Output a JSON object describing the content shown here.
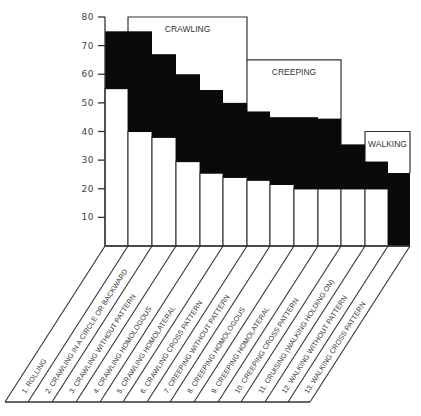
{
  "chart_data": {
    "type": "bar",
    "subtype": "floating-range",
    "title": "",
    "xlabel": "",
    "ylabel": "",
    "ylim": [
      0,
      80
    ],
    "yticks": [
      10,
      20,
      30,
      40,
      50,
      60,
      70,
      80
    ],
    "grid": false,
    "legend": null,
    "categories": [
      "1. ROLLING",
      "2. CRAWLING IN A CIRCLE OR BACKWARD",
      "3. CRAWLING WITHOUT PATTERN",
      "4. CRAWLING HOMOLOGOUS",
      "5. CRAWLING HOMOLATERAL",
      "6. CRAWLING CROSS PATTERN",
      "7. CREEPING WITHOUT PATTERN",
      "8. CREEPING HOMOLOGOUS",
      "9. CREEPING HOMOLATERAL",
      "10. CREEPING CROSS PATTERN",
      "11. CRUISING (WALKING HOLDING ON)",
      "12. WALKING WITHOUT PATTERN",
      "13. WALKING CROSS PATTERN"
    ],
    "series": [
      {
        "name": "range_low",
        "values": [
          55,
          40,
          38,
          29.5,
          25.5,
          24,
          23,
          21.5,
          20,
          20,
          20,
          20,
          0
        ]
      },
      {
        "name": "range_high",
        "values": [
          75,
          75,
          67,
          60,
          54.5,
          50,
          47,
          45,
          45,
          44.5,
          35.5,
          29.5,
          25.5
        ]
      }
    ],
    "annotations": [
      {
        "text": "CRAWLING",
        "bars": [
          2,
          6
        ],
        "box_top": 80,
        "box_right_bottom": 65
      },
      {
        "text": "CREEPING",
        "bars": [
          7,
          10
        ],
        "box_top": 65,
        "box_right_bottom": 35.5
      },
      {
        "text": "WALKING",
        "bars": [
          12,
          13
        ],
        "box_top": 40,
        "box_right_bottom": 25.5
      }
    ],
    "colors": {
      "range": "#0a0a0a",
      "below": "#ffffff",
      "line": "#333333"
    }
  }
}
